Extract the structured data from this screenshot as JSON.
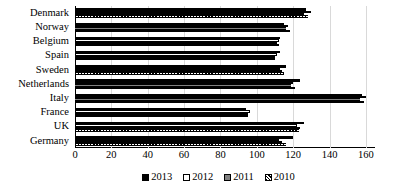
{
  "chart_data": {
    "type": "bar",
    "orientation": "horizontal",
    "title": "",
    "xlabel": "",
    "ylabel": "",
    "xlim": [
      0,
      165
    ],
    "grid": true,
    "legend_position": "bottom",
    "categories": [
      "Denmark",
      "Norway",
      "Belgium",
      "Spain",
      "Sweden",
      "Netherlands",
      "Italy",
      "France",
      "UK",
      "Germany"
    ],
    "xticks": [
      0,
      20,
      40,
      60,
      80,
      100,
      120,
      140,
      160
    ],
    "series": [
      {
        "name": "2013",
        "color": "#000000",
        "pattern": "solid-black",
        "values": [
          127,
          115,
          113,
          113,
          116,
          124,
          158,
          94,
          126,
          120
        ]
      },
      {
        "name": "2012",
        "color": "#ffffff",
        "pattern": "outline-white",
        "values": [
          130,
          117,
          112,
          111,
          113,
          120,
          160,
          96,
          122,
          112
        ]
      },
      {
        "name": "2011",
        "color": "#808080",
        "pattern": "solid-gray",
        "values": [
          126,
          116,
          111,
          110,
          114,
          119,
          157,
          95,
          124,
          114
        ]
      },
      {
        "name": "2010",
        "color": "#000000",
        "pattern": "diagonal-hatch",
        "values": [
          128,
          118,
          112,
          110,
          115,
          121,
          159,
          95,
          123,
          116
        ]
      }
    ]
  },
  "legend": {
    "items": [
      {
        "label": "2013",
        "style": "s2013"
      },
      {
        "label": "2012",
        "style": "s2012"
      },
      {
        "label": "2011",
        "style": "s2011"
      },
      {
        "label": "2010",
        "style": "s2010"
      }
    ]
  }
}
